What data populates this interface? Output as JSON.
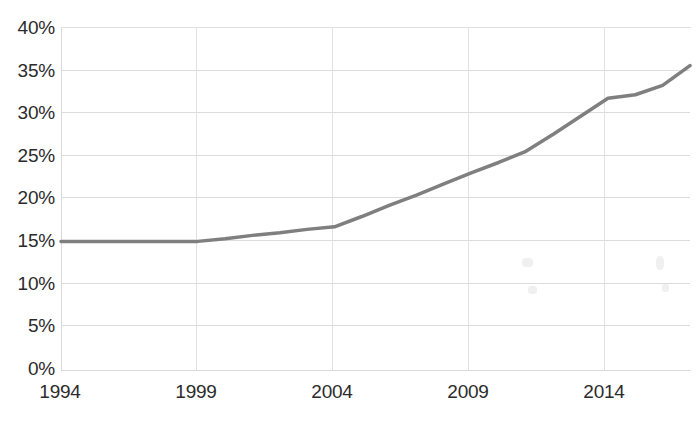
{
  "chart_data": {
    "type": "line",
    "title": "",
    "subtitle": "",
    "xlabel": "",
    "ylabel": "",
    "xlim": [
      1994,
      2017
    ],
    "ylim": [
      0,
      40
    ],
    "grid": true,
    "legend": false,
    "legend_position": "none",
    "line_color": "#7f7f7f",
    "line_width_px": 3.5,
    "y_tick_labels": [
      "0%",
      "5%",
      "10%",
      "15%",
      "20%",
      "25%",
      "30%",
      "35%",
      "40%"
    ],
    "y_tick_values": [
      0,
      5,
      10,
      15,
      20,
      25,
      30,
      35,
      40
    ],
    "x_tick_labels": [
      "1994",
      "1999",
      "2004",
      "2009",
      "2014"
    ],
    "x_tick_values": [
      1994,
      1999,
      2004,
      2009,
      2014
    ],
    "x": [
      1994,
      1995,
      1996,
      1997,
      1998,
      1999,
      2000,
      2001,
      2002,
      2003,
      2004,
      2005,
      2006,
      2007,
      2008,
      2009,
      2010,
      2011,
      2012,
      2013,
      2014,
      2015,
      2016,
      2017
    ],
    "values": [
      15.0,
      15.0,
      15.0,
      15.0,
      15.0,
      15.0,
      15.3,
      15.7,
      16.0,
      16.4,
      16.7,
      17.9,
      19.2,
      20.4,
      21.7,
      23.0,
      24.2,
      25.5,
      27.5,
      29.6,
      31.7,
      32.1,
      33.2,
      35.5
    ],
    "series": [
      {
        "name": "",
        "color": "#7f7f7f",
        "values": [
          15.0,
          15.0,
          15.0,
          15.0,
          15.0,
          15.0,
          15.3,
          15.7,
          16.0,
          16.4,
          16.7,
          17.9,
          19.2,
          20.4,
          21.7,
          23.0,
          24.2,
          25.5,
          27.5,
          29.6,
          31.7,
          32.1,
          33.2,
          35.5
        ]
      }
    ]
  },
  "axes": {
    "y_ticks": [
      {
        "label": "40%"
      },
      {
        "label": "35%"
      },
      {
        "label": "30%"
      },
      {
        "label": "25%"
      },
      {
        "label": "20%"
      },
      {
        "label": "15%"
      },
      {
        "label": "10%"
      },
      {
        "label": "5%"
      },
      {
        "label": "0%"
      }
    ],
    "x_ticks": [
      {
        "label": "1994"
      },
      {
        "label": "1999"
      },
      {
        "label": "2004"
      },
      {
        "label": "2009"
      },
      {
        "label": "2014"
      }
    ]
  }
}
